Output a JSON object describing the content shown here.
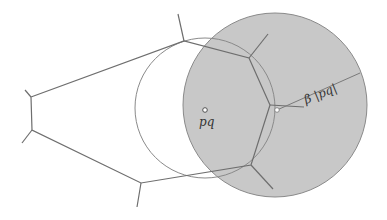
{
  "figure": {
    "labels": {
      "point": "pq",
      "radius": "β |pq|"
    },
    "colors": {
      "background": "#ffffff",
      "disk_fill": "#c8c8c8",
      "disk_stroke": "#8a8a8a",
      "circle_stroke": "#8a8a8a",
      "voronoi_stroke": "#6e6e6e",
      "point_fill": "#ffffff"
    },
    "disk": {
      "cx": 275,
      "cy": 105,
      "r": 92
    },
    "circle": {
      "cx": 205,
      "cy": 108,
      "r": 70
    },
    "point_pq": {
      "x": 205,
      "y": 110
    },
    "point_boundary": {
      "x": 277,
      "y": 110
    },
    "radius_line": {
      "x1": 277,
      "y1": 110,
      "x2": 360,
      "y2": 73
    }
  }
}
